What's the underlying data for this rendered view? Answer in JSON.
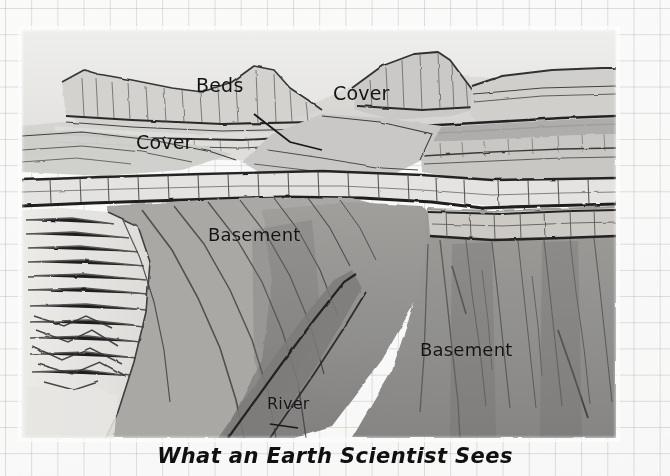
{
  "figure": {
    "caption": "What an Earth Scientist Sees",
    "background": "graph-paper-grid"
  },
  "annotations": [
    {
      "id": "beds",
      "text": "Beds",
      "has_leader_line": true
    },
    {
      "id": "cover-top",
      "text": "Cover",
      "has_leader_line": false
    },
    {
      "id": "cover-left",
      "text": "Cover",
      "has_leader_line": false
    },
    {
      "id": "basement-1",
      "text": "Basement",
      "has_leader_line": false
    },
    {
      "id": "basement-2",
      "text": "Basement",
      "has_leader_line": false
    },
    {
      "id": "river",
      "text": "River",
      "has_leader_line": true
    }
  ],
  "palette": {
    "paper": "#fcfcfc",
    "grid_line": "#969ba5",
    "sky": "#e8e8e6",
    "cover_light": "#d8d7d4",
    "cover_mid": "#c3c2bf",
    "bench_light": "#e2e1de",
    "basement_mid": "#a3a29f",
    "basement_dark": "#8b8a88",
    "basement_deep": "#7a7977",
    "ink": "#2b2b2b",
    "label_text": "#121212"
  }
}
